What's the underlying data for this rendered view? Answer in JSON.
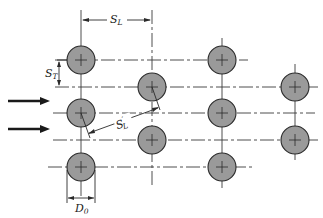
{
  "figure": {
    "labels": {
      "longitudinal_pitch": "S",
      "longitudinal_pitch_sub": "L",
      "transverse_pitch": "S",
      "transverse_pitch_sub": "T",
      "diagonal_pitch": "S",
      "diagonal_pitch_sup": "′",
      "diagonal_pitch_sub": "L",
      "tube_diameter": "D",
      "tube_diameter_sub": "0"
    },
    "flow_arrows": 2,
    "columns": [
      {
        "x": 81,
        "tubes_y": [
          60,
          113,
          167
        ]
      },
      {
        "x": 152,
        "tubes_y": [
          87,
          140
        ]
      },
      {
        "x": 222,
        "tubes_y": [
          60,
          113,
          167
        ]
      },
      {
        "x": 295,
        "tubes_y": [
          87,
          140
        ]
      }
    ],
    "tube_radius": 14,
    "colors": {
      "tube_fill": "#9a9a9a",
      "line": "#2a2a2a",
      "background": "#ffffff"
    }
  }
}
